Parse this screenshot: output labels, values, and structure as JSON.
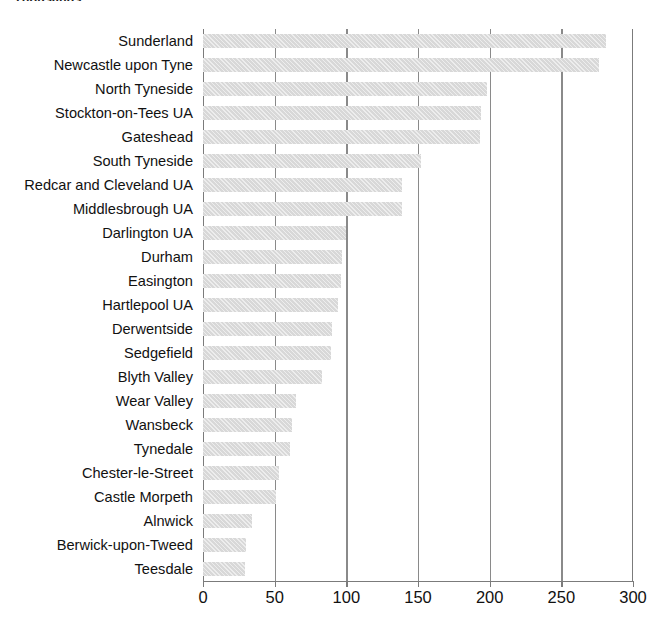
{
  "units_caption": "Thousands",
  "chart_data": {
    "type": "bar",
    "orientation": "horizontal",
    "title": "",
    "subtitle": "",
    "xlabel": "",
    "ylabel": "",
    "units": "Thousands",
    "xlim": [
      0,
      300
    ],
    "xticks": [
      0,
      50,
      100,
      150,
      200,
      250,
      300
    ],
    "xtick_labels": [
      "0",
      "50",
      "100",
      "150",
      "200",
      "250",
      "300"
    ],
    "grid": true,
    "grid_axis": "x",
    "legend": false,
    "bar_color": "#d8d8d8",
    "categories": [
      "Sunderland",
      "Newcastle upon Tyne",
      "North Tyneside",
      "Stockton-on-Tees UA",
      "Gateshead",
      "South Tyneside",
      "Redcar and Cleveland UA",
      "Middlesbrough UA",
      "Darlington UA",
      "Durham",
      "Easington",
      "Hartlepool UA",
      "Derwentside",
      "Sedgefield",
      "Blyth Valley",
      "Wear Valley",
      "Wansbeck",
      "Tynedale",
      "Chester-le-Street",
      "Castle Morpeth",
      "Alnwick",
      "Berwick-upon-Tweed",
      "Teesdale"
    ],
    "values": [
      281,
      276,
      198,
      194,
      193,
      152,
      139,
      139,
      100,
      97,
      96,
      94,
      90,
      89,
      83,
      65,
      62,
      61,
      53,
      51,
      34,
      30,
      29
    ]
  }
}
